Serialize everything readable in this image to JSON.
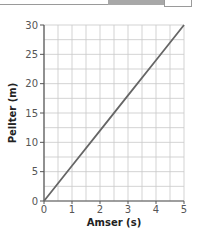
{
  "chart_data": {
    "type": "line",
    "title": "",
    "xlabel": "Amser (s)",
    "ylabel": "Pellter (m)",
    "xlim": [
      0,
      5
    ],
    "ylim": [
      0,
      30
    ],
    "x_ticks": [
      "0",
      "1",
      "2",
      "3",
      "4",
      "5"
    ],
    "y_ticks": [
      "0",
      "5",
      "10",
      "15",
      "20",
      "25",
      "30"
    ],
    "grid": true,
    "grid_minor_x_step": 0.5,
    "grid_minor_y_step": 2.5,
    "legend": null,
    "series": [
      {
        "name": "distance-time",
        "x": [
          0,
          1,
          2,
          3,
          4,
          5
        ],
        "y": [
          0,
          6,
          12,
          18,
          24,
          30
        ],
        "color": "#666666"
      }
    ]
  },
  "labels": {
    "xlabel": "Amser (s)",
    "ylabel": "Pellter (m)",
    "x_ticks": [
      "0",
      "1",
      "2",
      "3",
      "4",
      "5"
    ],
    "y_ticks": [
      "0",
      "5",
      "10",
      "15",
      "20",
      "25",
      "30"
    ]
  },
  "colors": {
    "grid": "#c8c8c8",
    "axis": "#555555",
    "line": "#666666"
  }
}
